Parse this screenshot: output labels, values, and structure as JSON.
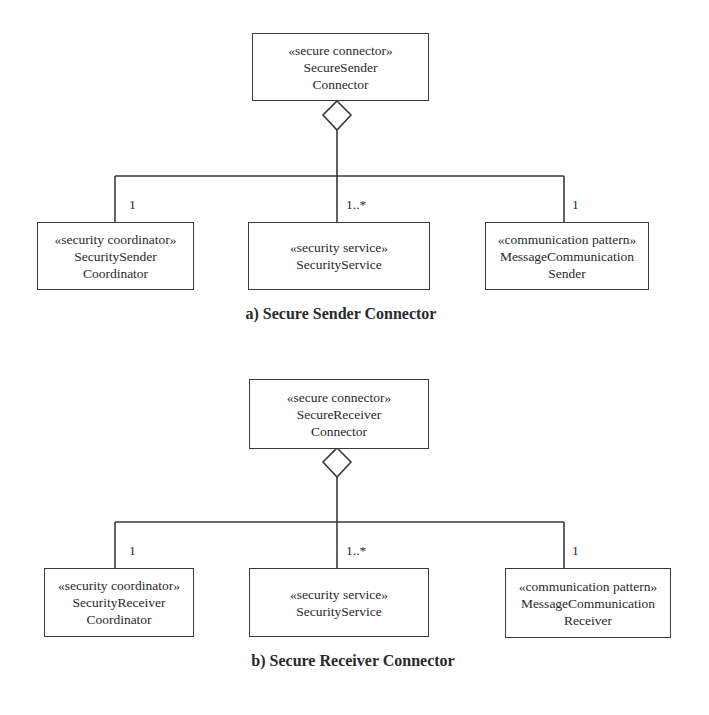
{
  "diagrams": [
    {
      "caption": "a) Secure Sender Connector",
      "whole": {
        "stereotype": "«secure connector»",
        "name_line1": "SecureSender",
        "name_line2": "Connector"
      },
      "parts": [
        {
          "stereotype": "«security coordinator»",
          "name_line1": "SecuritySender",
          "name_line2": "Coordinator",
          "multiplicity": "1"
        },
        {
          "stereotype": "«security service»",
          "name_line1": "SecurityService",
          "name_line2": "",
          "multiplicity": "1..*"
        },
        {
          "stereotype": "«communication pattern»",
          "name_line1": "MessageCommunication",
          "name_line2": "Sender",
          "multiplicity": "1"
        }
      ]
    },
    {
      "caption": "b) Secure Receiver Connector",
      "whole": {
        "stereotype": "«secure connector»",
        "name_line1": "SecureReceiver",
        "name_line2": "Connector"
      },
      "parts": [
        {
          "stereotype": "«security coordinator»",
          "name_line1": "SecurityReceiver",
          "name_line2": "Coordinator",
          "multiplicity": "1"
        },
        {
          "stereotype": "«security service»",
          "name_line1": "SecurityService",
          "name_line2": "",
          "multiplicity": "1..*"
        },
        {
          "stereotype": "«communication pattern»",
          "name_line1": "MessageCommunication",
          "name_line2": "Receiver",
          "multiplicity": "1"
        }
      ]
    }
  ],
  "colors": {
    "line": "#3a3a3a",
    "text": "#2a2a2a",
    "background": "#ffffff"
  }
}
